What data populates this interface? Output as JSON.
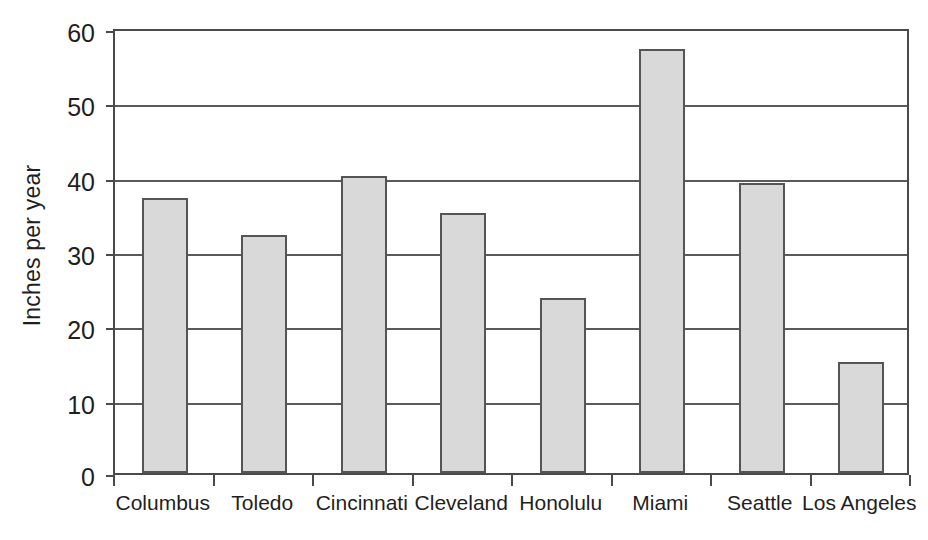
{
  "chart_data": {
    "type": "bar",
    "title": "",
    "subtitle": "",
    "xlabel": "",
    "ylabel": "Inches per year",
    "categories": [
      "Columbus",
      "Toledo",
      "Cincinnati",
      "Cleveland",
      "Honolulu",
      "Miami",
      "Seattle",
      "Los Angeles"
    ],
    "values": [
      37,
      32,
      40,
      35,
      23.5,
      57,
      39,
      15
    ],
    "series": [
      {
        "name": "Annual precipitation",
        "values": [
          37,
          32,
          40,
          35,
          23.5,
          57,
          39,
          15
        ]
      }
    ],
    "ylim": [
      0,
      60
    ],
    "ytick_values": [
      0,
      10,
      20,
      30,
      40,
      50,
      60
    ],
    "ytick_labels": [
      "0",
      "10",
      "20",
      "30",
      "40",
      "50",
      "60"
    ],
    "grid": true,
    "grid_axis": "y",
    "legend": false,
    "legend_position": "none",
    "annotations": [],
    "bar_fill_color": "#d9d9d9",
    "bar_edge_color": "#555555",
    "axis_color": "#4a4a4a",
    "grid_color": "#5a5a5a",
    "background_color": "#ffffff"
  }
}
